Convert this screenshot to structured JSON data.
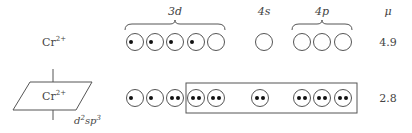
{
  "header": {
    "orbital_3d": "3d",
    "orbital_4s": "4s",
    "orbital_4p": "4p",
    "mu": "μ"
  },
  "rows": [
    {
      "ion": "Cr",
      "charge": "2+",
      "orbitals_3d": [
        1,
        1,
        1,
        1,
        0
      ],
      "orbitals_4s": [
        0
      ],
      "orbitals_4p": [
        0,
        0,
        0
      ],
      "mu": "4.9"
    },
    {
      "ion": "Cr",
      "charge": "2+",
      "hybrid_label_d": "d",
      "hybrid_label_d_sup": "2",
      "hybrid_label_sp": "sp",
      "hybrid_label_sp_sup": "3",
      "orbitals_3d": [
        1,
        1,
        2,
        2,
        2
      ],
      "orbitals_4s": [
        2
      ],
      "orbitals_4p": [
        2,
        2,
        2
      ],
      "mu": "2.8"
    }
  ]
}
